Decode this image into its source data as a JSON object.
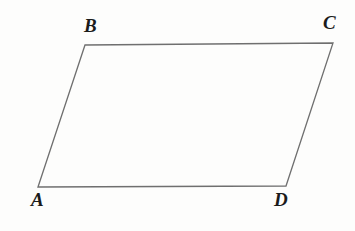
{
  "figure": {
    "name": "parallelogram-ABCD",
    "shape_type": "parallelogram",
    "background_color": "#fdfdfc",
    "stroke_color": "#6f6f6f",
    "stroke_width": 1.3,
    "fill_color": "none",
    "label_color": "#1b1b1b",
    "vertices": [
      {
        "id": "A",
        "label": "A",
        "x": 38,
        "y": 187
      },
      {
        "id": "B",
        "label": "B",
        "x": 85,
        "y": 45
      },
      {
        "id": "C",
        "label": "C",
        "x": 333,
        "y": 43
      },
      {
        "id": "D",
        "label": "D",
        "x": 286,
        "y": 186
      }
    ],
    "edges": [
      {
        "from": "A",
        "to": "B"
      },
      {
        "from": "B",
        "to": "C"
      },
      {
        "from": "C",
        "to": "D"
      },
      {
        "from": "D",
        "to": "A"
      }
    ],
    "polygon_points": "38,187 85,45 333,43 286,186",
    "labels": {
      "A": "A",
      "B": "B",
      "C": "C",
      "D": "D"
    }
  }
}
